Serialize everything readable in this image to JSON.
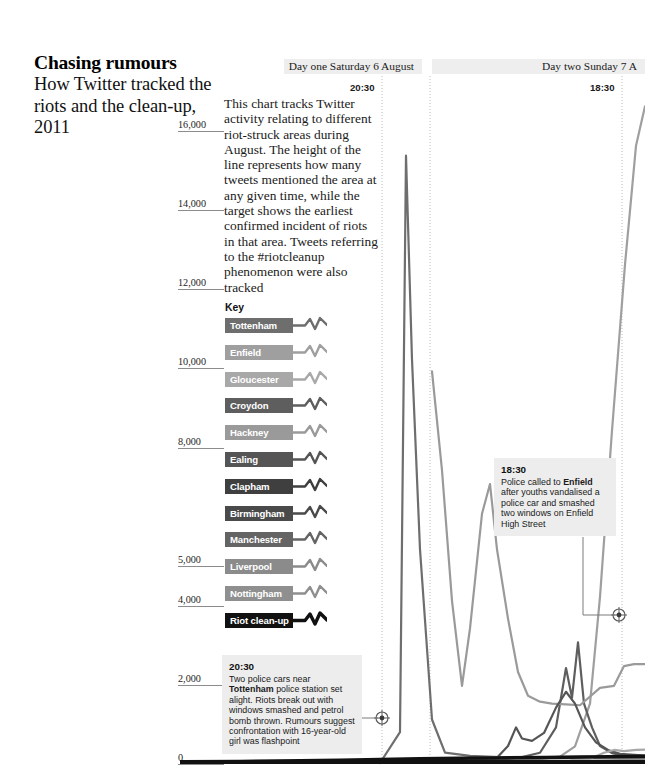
{
  "masthead": {
    "headline": "Chasing rumours",
    "standfirst": "How Twitter tracked the riots and the clean-up, 2011"
  },
  "intro": {
    "text": "This chart tracks Twitter activity relating to different riot-struck areas during August. The height of the line represents how many tweets mentioned the area at any given time, while the target shows the earliest confirmed incident of riots in that area. Tweets referring to the #riotcleanup phenomenon were also tracked"
  },
  "day_headers": [
    {
      "label": "Day one Saturday 6 August",
      "time_tick": "20:30"
    },
    {
      "label": "Day two Sunday 7 A",
      "time_tick": "18:30"
    }
  ],
  "key": {
    "title": "Key",
    "items": [
      {
        "label": "Tottenham",
        "color": "#6e6e6e"
      },
      {
        "label": "Enfield",
        "color": "#9f9f9f"
      },
      {
        "label": "Gloucester",
        "color": "#a8a8a8"
      },
      {
        "label": "Croydon",
        "color": "#5e5e5e"
      },
      {
        "label": "Hackney",
        "color": "#9a9a9a"
      },
      {
        "label": "Ealing",
        "color": "#555555"
      },
      {
        "label": "Clapham",
        "color": "#3f3f3f"
      },
      {
        "label": "Birmingham",
        "color": "#4a4a4a"
      },
      {
        "label": "Manchester",
        "color": "#646464"
      },
      {
        "label": "Liverpool",
        "color": "#8b8b8b"
      },
      {
        "label": "Nottingham",
        "color": "#8f8f8f"
      },
      {
        "label": "Riot clean-up",
        "color": "#111111"
      }
    ]
  },
  "annotations": [
    {
      "time": "20:30",
      "text_before": "Two police cars near ",
      "bold": "Tottenham",
      "text_after": " police station set alight. Riots break out with windows smashed and petrol bomb thrown. Rumours suggest confrontation with 16-year-old girl was flashpoint"
    },
    {
      "time": "18:30",
      "text_before": "Police called to ",
      "bold": "Enfield",
      "text_after": " after youths vandalised a police car and smashed two windows on Enfield High Street"
    }
  ],
  "chart_data": {
    "type": "line",
    "title": "Chasing rumours",
    "xlabel": "",
    "ylabel": "Tweets",
    "ylim": [
      0,
      17000
    ],
    "yticks": [
      16000,
      14000,
      12000,
      10000,
      8000,
      5000,
      4000,
      2000,
      0
    ],
    "ytick_labels": [
      "16,000",
      "14,000",
      "12,000",
      "10,000",
      "8,000",
      "5,000",
      "4,000",
      "2,000",
      "0"
    ],
    "grid": "vertical-dotted",
    "legend_position": "left-panel",
    "gridlines_x": [
      382,
      430,
      622
    ],
    "series": [
      {
        "name": "Tottenham",
        "color": "#6e6e6e",
        "points": [
          [
            380,
            0
          ],
          [
            400,
            780
          ],
          [
            406,
            15350
          ],
          [
            412,
            10200
          ],
          [
            420,
            5400
          ],
          [
            432,
            1100
          ],
          [
            445,
            260
          ],
          [
            470,
            180
          ],
          [
            500,
            150
          ],
          [
            540,
            130
          ],
          [
            580,
            120
          ],
          [
            620,
            110
          ],
          [
            645,
            110
          ]
        ]
      },
      {
        "name": "Enfield",
        "color": "#9f9f9f",
        "points": [
          [
            430,
            60
          ],
          [
            470,
            70
          ],
          [
            505,
            80
          ],
          [
            540,
            100
          ],
          [
            560,
            160
          ],
          [
            575,
            420
          ],
          [
            590,
            1500
          ],
          [
            600,
            4200
          ],
          [
            612,
            8400
          ],
          [
            625,
            12600
          ],
          [
            636,
            15600
          ],
          [
            645,
            16600
          ]
        ]
      },
      {
        "name": "Croydon",
        "color": "#5e5e5e",
        "points": [
          [
            430,
            40
          ],
          [
            470,
            60
          ],
          [
            500,
            90
          ],
          [
            520,
            140
          ],
          [
            540,
            260
          ],
          [
            556,
            900
          ],
          [
            566,
            2400
          ],
          [
            572,
            1650
          ],
          [
            578,
            3050
          ],
          [
            584,
            1500
          ],
          [
            592,
            900
          ],
          [
            600,
            430
          ],
          [
            612,
            250
          ],
          [
            625,
            180
          ],
          [
            645,
            160
          ]
        ]
      },
      {
        "name": "Hackney",
        "color": "#9a9a9a",
        "points": [
          [
            432,
            9900
          ],
          [
            442,
            7400
          ],
          [
            452,
            4100
          ],
          [
            462,
            1950
          ],
          [
            470,
            3400
          ],
          [
            482,
            6300
          ],
          [
            490,
            7050
          ],
          [
            497,
            5400
          ],
          [
            508,
            3650
          ],
          [
            518,
            2300
          ],
          [
            528,
            1700
          ],
          [
            540,
            1550
          ],
          [
            552,
            1500
          ],
          [
            566,
            1480
          ],
          [
            580,
            1460
          ],
          [
            600,
            1900
          ],
          [
            614,
            1950
          ],
          [
            624,
            2450
          ],
          [
            634,
            2500
          ],
          [
            645,
            2500
          ]
        ]
      },
      {
        "name": "Ealing",
        "color": "#555555",
        "points": [
          [
            430,
            30
          ],
          [
            470,
            50
          ],
          [
            496,
            110
          ],
          [
            508,
            430
          ],
          [
            516,
            900
          ],
          [
            522,
            620
          ],
          [
            532,
            560
          ],
          [
            544,
            760
          ],
          [
            556,
            1400
          ],
          [
            566,
            1800
          ],
          [
            575,
            1500
          ],
          [
            585,
            900
          ],
          [
            596,
            520
          ],
          [
            608,
            330
          ],
          [
            620,
            230
          ],
          [
            645,
            190
          ]
        ]
      },
      {
        "name": "Gloucester",
        "color": "#a8a8a8",
        "points": [
          [
            430,
            20
          ],
          [
            480,
            30
          ],
          [
            530,
            45
          ],
          [
            570,
            70
          ],
          [
            590,
            110
          ],
          [
            604,
            260
          ],
          [
            614,
            330
          ],
          [
            624,
            300
          ],
          [
            636,
            330
          ],
          [
            645,
            340
          ]
        ]
      },
      {
        "name": "Riot clean-up",
        "color": "#111111",
        "points": [
          [
            182,
            30
          ],
          [
            240,
            40
          ],
          [
            300,
            55
          ],
          [
            340,
            70
          ],
          [
            380,
            90
          ],
          [
            420,
            110
          ],
          [
            460,
            120
          ],
          [
            500,
            130
          ],
          [
            545,
            140
          ],
          [
            580,
            150
          ],
          [
            610,
            160
          ],
          [
            645,
            170
          ]
        ]
      }
    ],
    "targets": [
      {
        "label": "Tottenham",
        "x": 382,
        "y": 718
      },
      {
        "label": "Enfield",
        "x": 619,
        "y": 615
      }
    ]
  }
}
